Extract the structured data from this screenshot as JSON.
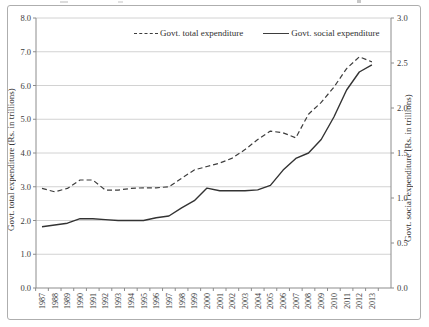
{
  "figure": {
    "type_hint": "line-chart-figure",
    "legend": [
      {
        "label": "Govt. total expenditure",
        "style": "dashed"
      },
      {
        "label": "Govt. social expenditure",
        "style": "solid"
      }
    ]
  },
  "chart_data": {
    "type": "line",
    "x": [
      1987,
      1988,
      1989,
      1990,
      1991,
      1992,
      1993,
      1994,
      1995,
      1996,
      1997,
      1998,
      1999,
      2000,
      2001,
      2002,
      2003,
      2004,
      2005,
      2006,
      2007,
      2008,
      2009,
      2010,
      2011,
      2012,
      2013
    ],
    "series": [
      {
        "name": "Govt. total expenditure",
        "axis": "left",
        "line": "dashed",
        "color": "#3d3d3d",
        "values": [
          2.95,
          2.85,
          2.95,
          3.2,
          3.2,
          2.9,
          2.9,
          2.95,
          2.97,
          2.97,
          3.0,
          3.25,
          3.5,
          3.6,
          3.7,
          3.85,
          4.1,
          4.4,
          4.65,
          4.6,
          4.45,
          5.15,
          5.5,
          5.95,
          6.5,
          6.85,
          6.7
        ]
      },
      {
        "name": "Govt. social expenditure",
        "axis": "right",
        "line": "solid",
        "color": "#333333",
        "values": [
          0.68,
          0.7,
          0.72,
          0.77,
          0.77,
          0.76,
          0.75,
          0.75,
          0.75,
          0.78,
          0.8,
          0.89,
          0.97,
          1.11,
          1.08,
          1.08,
          1.08,
          1.09,
          1.14,
          1.31,
          1.44,
          1.5,
          1.65,
          1.9,
          2.2,
          2.4,
          2.48
        ]
      }
    ],
    "left_axis": {
      "label": "Govt. total expenditure (Rs. in trillions)",
      "min": 0,
      "max": 8,
      "step": 1,
      "tick_decimals": 1
    },
    "right_axis": {
      "label": "Govt. social expenditure (Rs. in trillions)",
      "min": 0,
      "max": 3,
      "step": 0.5,
      "tick_decimals": 1
    },
    "grid": true,
    "legend_position": "top-center",
    "gridline_color": "#d2d2d2",
    "axis_color": "#8c8c8c",
    "text_color": "#3a3a3a"
  }
}
